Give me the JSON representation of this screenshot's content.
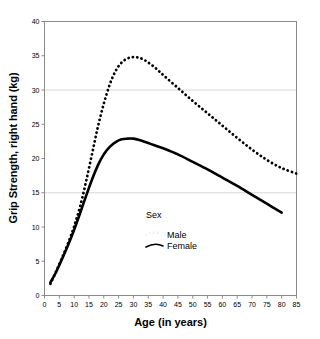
{
  "chart_data": {
    "type": "line",
    "title": "",
    "xlabel": "Age (in years)",
    "ylabel": "Grip Strength, right hand (kg)",
    "xlim": [
      0,
      85
    ],
    "ylim": [
      0,
      40
    ],
    "xticks": [
      0,
      5,
      10,
      15,
      20,
      25,
      30,
      35,
      40,
      45,
      50,
      55,
      60,
      65,
      70,
      75,
      80,
      85
    ],
    "yticks": [
      0,
      5,
      10,
      15,
      20,
      25,
      30,
      35,
      40
    ],
    "grid": "faint horizontal gridlines at y = 15 and y = 30",
    "legend": {
      "title": "Sex",
      "position": "inside-lower-center",
      "entries": [
        {
          "name": "Male",
          "style": "dotted"
        },
        {
          "name": "Female",
          "style": "solid"
        }
      ]
    },
    "series": [
      {
        "name": "Male",
        "style": "dotted",
        "color": "#000000",
        "x": [
          2,
          4,
          6,
          8,
          10,
          12,
          14,
          16,
          18,
          20,
          22,
          24,
          26,
          28,
          30,
          32,
          34,
          36,
          38,
          40,
          45,
          50,
          55,
          60,
          65,
          70,
          75,
          80,
          85
        ],
        "y": [
          1.7,
          3.6,
          5.6,
          7.7,
          10.1,
          13.0,
          16.6,
          20.6,
          24.6,
          28.0,
          30.8,
          32.8,
          34.0,
          34.6,
          34.8,
          34.7,
          34.3,
          33.7,
          33.0,
          32.2,
          30.3,
          28.4,
          26.6,
          24.8,
          23.0,
          21.3,
          19.8,
          18.6,
          17.8
        ]
      },
      {
        "name": "Female",
        "style": "solid",
        "color": "#000000",
        "x": [
          2,
          4,
          6,
          8,
          10,
          12,
          14,
          16,
          18,
          20,
          22,
          24,
          26,
          28,
          30,
          32,
          34,
          36,
          38,
          40,
          45,
          50,
          55,
          60,
          65,
          70,
          75,
          80
        ],
        "y": [
          1.9,
          3.5,
          5.4,
          7.4,
          9.6,
          12.0,
          14.5,
          16.9,
          19.0,
          20.6,
          21.7,
          22.4,
          22.8,
          22.9,
          22.9,
          22.7,
          22.4,
          22.1,
          21.8,
          21.5,
          20.6,
          19.5,
          18.4,
          17.2,
          16.0,
          14.7,
          13.4,
          12.1
        ]
      }
    ]
  },
  "axis": {
    "x_tick_labels": [
      "0",
      "5",
      "10",
      "15",
      "20",
      "25",
      "30",
      "35",
      "40",
      "45",
      "50",
      "55",
      "60",
      "65",
      "70",
      "75",
      "80",
      "85"
    ],
    "y_tick_labels": [
      "0",
      "5",
      "10",
      "15",
      "20",
      "25",
      "30",
      "35",
      "40"
    ]
  },
  "legend": {
    "title": "Sex",
    "male_label": "Male",
    "female_label": "Female"
  },
  "colors": {
    "line": "#000000",
    "frame": "#808080",
    "grid": "#d8d8d8",
    "background": "#ffffff"
  }
}
